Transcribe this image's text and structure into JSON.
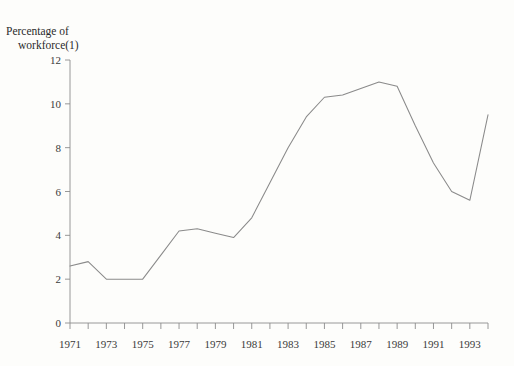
{
  "chart_data": {
    "type": "line",
    "title": "Percentage of workforce(1)",
    "title_line_1": "Percentage of",
    "title_line_2": "workforce(1)",
    "xlabel": "",
    "ylabel": "Percentage of workforce(1)",
    "ylim": [
      0,
      12
    ],
    "xlim": [
      1971,
      1994
    ],
    "grid": false,
    "legend": null,
    "y_ticks": [
      0,
      2,
      4,
      6,
      8,
      10,
      12
    ],
    "y_tick_labels": [
      "0",
      "2",
      "4",
      "6",
      "8",
      "10",
      "12"
    ],
    "x_ticks": [
      1971,
      1972,
      1973,
      1974,
      1975,
      1976,
      1977,
      1978,
      1979,
      1980,
      1981,
      1982,
      1983,
      1984,
      1985,
      1986,
      1987,
      1988,
      1989,
      1990,
      1991,
      1992,
      1993,
      1994
    ],
    "x_tick_labels": [
      "1971",
      "",
      "1973",
      "",
      "1975",
      "",
      "1977",
      "",
      "1979",
      "",
      "1981",
      "",
      "1983",
      "",
      "1985",
      "",
      "1987",
      "",
      "1989",
      "",
      "1991",
      "",
      "1993",
      ""
    ],
    "x": [
      1971,
      1972,
      1973,
      1974,
      1975,
      1976,
      1977,
      1978,
      1979,
      1980,
      1981,
      1982,
      1983,
      1984,
      1985,
      1986,
      1987,
      1988,
      1989,
      1990,
      1991,
      1992,
      1993,
      1994
    ],
    "values": [
      2.6,
      2.8,
      2.0,
      2.0,
      2.0,
      3.1,
      4.2,
      4.3,
      4.1,
      3.9,
      4.8,
      6.4,
      8.0,
      9.4,
      10.3,
      10.4,
      10.7,
      11.0,
      10.8,
      9.0,
      7.3,
      6.0,
      5.6,
      9.5
    ],
    "series": [
      {
        "name": "Percentage of workforce",
        "points": [
          {
            "x": 1971,
            "y": 2.6
          },
          {
            "x": 1972,
            "y": 2.8
          },
          {
            "x": 1973,
            "y": 2.0
          },
          {
            "x": 1974,
            "y": 2.0
          },
          {
            "x": 1975,
            "y": 2.0
          },
          {
            "x": 1976,
            "y": 3.1
          },
          {
            "x": 1977,
            "y": 4.2
          },
          {
            "x": 1978,
            "y": 4.3
          },
          {
            "x": 1979,
            "y": 4.1
          },
          {
            "x": 1980,
            "y": 3.9
          },
          {
            "x": 1981,
            "y": 4.8
          },
          {
            "x": 1982,
            "y": 6.4
          },
          {
            "x": 1983,
            "y": 8.0
          },
          {
            "x": 1984,
            "y": 9.4
          },
          {
            "x": 1985,
            "y": 10.3
          },
          {
            "x": 1986,
            "y": 10.4
          },
          {
            "x": 1987,
            "y": 10.7
          },
          {
            "x": 1988,
            "y": 11.0
          },
          {
            "x": 1989,
            "y": 10.8
          },
          {
            "x": 1990,
            "y": 9.0
          },
          {
            "x": 1991,
            "y": 7.3
          },
          {
            "x": 1992,
            "y": 6.0
          },
          {
            "x": 1993,
            "y": 5.6
          },
          {
            "x": 1994,
            "y": 9.5
          }
        ]
      }
    ],
    "line_color": "#8a8a8a",
    "background_color": "#fdfdfb",
    "axis_color": "#8c8c8c"
  }
}
